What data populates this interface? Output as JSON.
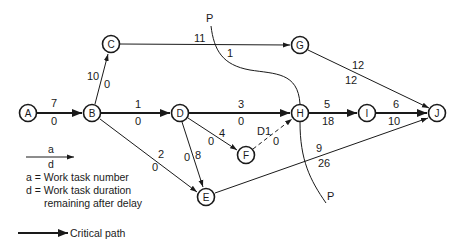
{
  "colors": {
    "ink": "#1a1a1a",
    "background": "#ffffff"
  },
  "nodes": [
    {
      "id": "A",
      "label": "A",
      "x": 28,
      "y": 113
    },
    {
      "id": "B",
      "label": "B",
      "x": 92,
      "y": 113
    },
    {
      "id": "C",
      "label": "C",
      "x": 111,
      "y": 44
    },
    {
      "id": "D",
      "label": "D",
      "x": 180,
      "y": 113
    },
    {
      "id": "E",
      "label": "E",
      "x": 206,
      "y": 197
    },
    {
      "id": "F",
      "label": "F",
      "x": 246,
      "y": 155
    },
    {
      "id": "G",
      "label": "G",
      "x": 300,
      "y": 45
    },
    {
      "id": "H",
      "label": "H",
      "x": 300,
      "y": 113
    },
    {
      "id": "I",
      "label": "I",
      "x": 367,
      "y": 113
    },
    {
      "id": "J",
      "label": "J",
      "x": 437,
      "y": 113
    }
  ],
  "edges": [
    {
      "from": "A",
      "to": "B",
      "task": "7",
      "duration": "0",
      "critical": true
    },
    {
      "from": "B",
      "to": "C",
      "task": "10",
      "duration": "0",
      "critical": false
    },
    {
      "from": "B",
      "to": "D",
      "task": "1",
      "duration": "0",
      "critical": true
    },
    {
      "from": "B",
      "to": "E",
      "task": "2",
      "duration": "0",
      "critical": false
    },
    {
      "from": "C",
      "to": "G",
      "task": "11",
      "duration": "1",
      "critical": false
    },
    {
      "from": "D",
      "to": "H",
      "task": "3",
      "duration": "0",
      "critical": true
    },
    {
      "from": "D",
      "to": "F",
      "task": "4",
      "duration": "0",
      "critical": false
    },
    {
      "from": "D",
      "to": "E",
      "task": "8",
      "duration": "0",
      "critical": false
    },
    {
      "from": "F",
      "to": "H",
      "task": "D1",
      "duration": "0",
      "critical": false,
      "dummy": true
    },
    {
      "from": "G",
      "to": "J",
      "task": "12",
      "duration": "12",
      "critical": false
    },
    {
      "from": "H",
      "to": "I",
      "task": "5",
      "duration": "18",
      "critical": true
    },
    {
      "from": "I",
      "to": "J",
      "task": "6",
      "duration": "10",
      "critical": true
    },
    {
      "from": "E",
      "to": "J",
      "task": "9",
      "duration": "26",
      "critical": false
    }
  ],
  "cut_line": {
    "label_top": "P",
    "label_bottom": "P"
  },
  "legend": {
    "arrow_top": "a",
    "arrow_bottom": "d",
    "line1": "a = Work task number",
    "line2": "d = Work task duration",
    "line3": "remaining after delay",
    "critical_label": "Critical path"
  }
}
